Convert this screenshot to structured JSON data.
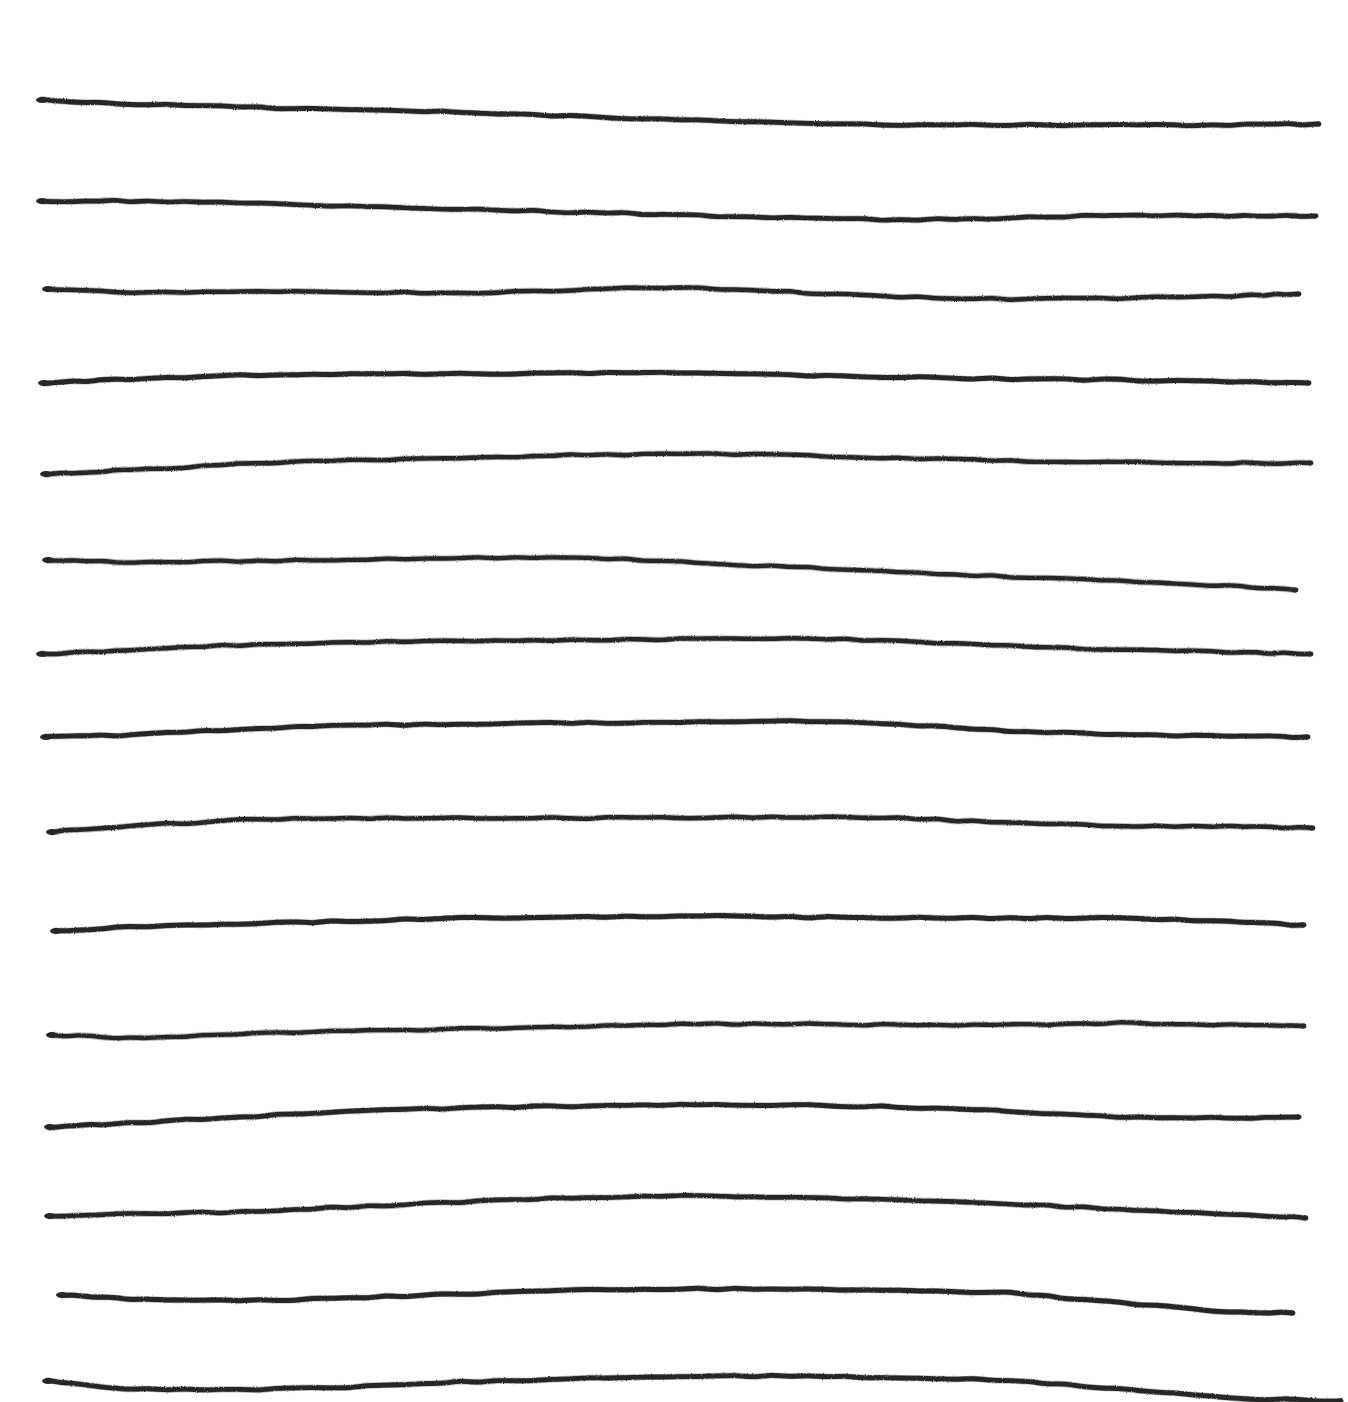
{
  "document": {
    "title": "Hand-drawn Horizontal Lines",
    "medium": "pen-on-paper sketch",
    "background_color": "#ffffff",
    "ink_color": "#262626",
    "canvas": {
      "width": 1348,
      "height": 1402
    },
    "line_count": 15,
    "description": "Fifteen roughly parallel, freehand horizontal lines drawn across a white page, each with gentle undulations and small ink blobs at the terminations."
  },
  "chart_data": {
    "type": "line",
    "subtitle": "",
    "xlabel": "",
    "ylabel": "",
    "xlim": [
      0,
      1348
    ],
    "ylim": [
      0,
      1402
    ],
    "grid": false,
    "legend": null,
    "axis_visible": false,
    "tick_labels_x": [],
    "tick_labels_y": [],
    "stroke_color": "#262626",
    "stroke_width": 4.6,
    "background": "#ffffff",
    "series": [
      {
        "name": "line-1",
        "x_start": 42,
        "x_end": 1318,
        "values": [
          [
            42,
            100
          ],
          [
            130,
            104
          ],
          [
            240,
            107
          ],
          [
            350,
            110
          ],
          [
            460,
            112
          ],
          [
            570,
            116
          ],
          [
            680,
            120
          ],
          [
            790,
            123
          ],
          [
            900,
            125
          ],
          [
            1010,
            125
          ],
          [
            1120,
            125
          ],
          [
            1230,
            125
          ],
          [
            1318,
            124
          ]
        ]
      },
      {
        "name": "line-2",
        "x_start": 42,
        "x_end": 1315,
        "values": [
          [
            42,
            201
          ],
          [
            130,
            201
          ],
          [
            240,
            203
          ],
          [
            350,
            206
          ],
          [
            460,
            209
          ],
          [
            570,
            212
          ],
          [
            680,
            215
          ],
          [
            790,
            218
          ],
          [
            900,
            220
          ],
          [
            1010,
            218
          ],
          [
            1120,
            215
          ],
          [
            1230,
            216
          ],
          [
            1315,
            216
          ]
        ]
      },
      {
        "name": "line-3",
        "x_start": 48,
        "x_end": 1298,
        "values": [
          [
            48,
            289
          ],
          [
            130,
            293
          ],
          [
            240,
            291
          ],
          [
            350,
            292
          ],
          [
            460,
            293
          ],
          [
            570,
            290
          ],
          [
            680,
            287
          ],
          [
            790,
            292
          ],
          [
            900,
            297
          ],
          [
            1010,
            299
          ],
          [
            1120,
            298
          ],
          [
            1230,
            296
          ],
          [
            1298,
            294
          ]
        ]
      },
      {
        "name": "line-4",
        "x_start": 44,
        "x_end": 1308,
        "values": [
          [
            44,
            383
          ],
          [
            130,
            379
          ],
          [
            240,
            375
          ],
          [
            350,
            374
          ],
          [
            460,
            374
          ],
          [
            570,
            373
          ],
          [
            680,
            373
          ],
          [
            790,
            375
          ],
          [
            900,
            377
          ],
          [
            1010,
            379
          ],
          [
            1120,
            380
          ],
          [
            1230,
            382
          ],
          [
            1308,
            383
          ]
        ]
      },
      {
        "name": "line-5",
        "x_start": 46,
        "x_end": 1310,
        "values": [
          [
            46,
            474
          ],
          [
            130,
            470
          ],
          [
            240,
            464
          ],
          [
            350,
            460
          ],
          [
            460,
            458
          ],
          [
            570,
            455
          ],
          [
            680,
            454
          ],
          [
            790,
            455
          ],
          [
            900,
            458
          ],
          [
            1010,
            461
          ],
          [
            1120,
            462
          ],
          [
            1230,
            463
          ],
          [
            1310,
            463
          ]
        ]
      },
      {
        "name": "line-6",
        "x_start": 48,
        "x_end": 1295,
        "values": [
          [
            48,
            560
          ],
          [
            130,
            562
          ],
          [
            240,
            561
          ],
          [
            350,
            560
          ],
          [
            460,
            558
          ],
          [
            570,
            557
          ],
          [
            680,
            562
          ],
          [
            790,
            567
          ],
          [
            900,
            572
          ],
          [
            1010,
            577
          ],
          [
            1120,
            581
          ],
          [
            1230,
            586
          ],
          [
            1295,
            590
          ]
        ]
      },
      {
        "name": "line-7",
        "x_start": 42,
        "x_end": 1310,
        "values": [
          [
            42,
            654
          ],
          [
            130,
            650
          ],
          [
            240,
            645
          ],
          [
            350,
            642
          ],
          [
            460,
            641
          ],
          [
            570,
            640
          ],
          [
            680,
            639
          ],
          [
            790,
            638
          ],
          [
            900,
            641
          ],
          [
            1010,
            646
          ],
          [
            1120,
            650
          ],
          [
            1230,
            652
          ],
          [
            1310,
            654
          ]
        ]
      },
      {
        "name": "line-8",
        "x_start": 46,
        "x_end": 1307,
        "values": [
          [
            46,
            737
          ],
          [
            130,
            735
          ],
          [
            240,
            729
          ],
          [
            350,
            725
          ],
          [
            460,
            724
          ],
          [
            570,
            723
          ],
          [
            680,
            722
          ],
          [
            790,
            721
          ],
          [
            900,
            724
          ],
          [
            1010,
            731
          ],
          [
            1120,
            735
          ],
          [
            1230,
            736
          ],
          [
            1307,
            737
          ]
        ]
      },
      {
        "name": "line-9",
        "x_start": 52,
        "x_end": 1312,
        "values": [
          [
            52,
            832
          ],
          [
            130,
            826
          ],
          [
            240,
            820
          ],
          [
            350,
            818
          ],
          [
            460,
            818
          ],
          [
            570,
            818
          ],
          [
            680,
            818
          ],
          [
            790,
            817
          ],
          [
            900,
            818
          ],
          [
            1010,
            823
          ],
          [
            1120,
            826
          ],
          [
            1230,
            826
          ],
          [
            1312,
            828
          ]
        ]
      },
      {
        "name": "line-10",
        "x_start": 56,
        "x_end": 1303,
        "values": [
          [
            56,
            931
          ],
          [
            130,
            927
          ],
          [
            240,
            924
          ],
          [
            350,
            921
          ],
          [
            460,
            918
          ],
          [
            570,
            917
          ],
          [
            680,
            916
          ],
          [
            790,
            917
          ],
          [
            900,
            918
          ],
          [
            1010,
            918
          ],
          [
            1120,
            918
          ],
          [
            1230,
            922
          ],
          [
            1303,
            925
          ]
        ]
      },
      {
        "name": "line-11",
        "x_start": 52,
        "x_end": 1303,
        "values": [
          [
            52,
            1035
          ],
          [
            130,
            1038
          ],
          [
            240,
            1034
          ],
          [
            350,
            1031
          ],
          [
            460,
            1029
          ],
          [
            570,
            1027
          ],
          [
            680,
            1024
          ],
          [
            790,
            1024
          ],
          [
            900,
            1025
          ],
          [
            1010,
            1025
          ],
          [
            1120,
            1023
          ],
          [
            1230,
            1025
          ],
          [
            1303,
            1026
          ]
        ]
      },
      {
        "name": "line-12",
        "x_start": 50,
        "x_end": 1298,
        "values": [
          [
            50,
            1127
          ],
          [
            130,
            1123
          ],
          [
            240,
            1117
          ],
          [
            350,
            1111
          ],
          [
            460,
            1108
          ],
          [
            570,
            1106
          ],
          [
            680,
            1105
          ],
          [
            790,
            1105
          ],
          [
            900,
            1107
          ],
          [
            1010,
            1111
          ],
          [
            1120,
            1117
          ],
          [
            1230,
            1118
          ],
          [
            1298,
            1117
          ]
        ]
      },
      {
        "name": "line-13",
        "x_start": 50,
        "x_end": 1305,
        "values": [
          [
            50,
            1216
          ],
          [
            130,
            1214
          ],
          [
            240,
            1212
          ],
          [
            350,
            1207
          ],
          [
            460,
            1202
          ],
          [
            570,
            1198
          ],
          [
            680,
            1196
          ],
          [
            790,
            1197
          ],
          [
            900,
            1200
          ],
          [
            1010,
            1204
          ],
          [
            1120,
            1209
          ],
          [
            1230,
            1214
          ],
          [
            1305,
            1218
          ]
        ]
      },
      {
        "name": "line-14",
        "x_start": 62,
        "x_end": 1292,
        "values": [
          [
            62,
            1295
          ],
          [
            130,
            1299
          ],
          [
            240,
            1301
          ],
          [
            350,
            1298
          ],
          [
            460,
            1294
          ],
          [
            570,
            1290
          ],
          [
            680,
            1289
          ],
          [
            790,
            1289
          ],
          [
            900,
            1290
          ],
          [
            1010,
            1293
          ],
          [
            1120,
            1303
          ],
          [
            1230,
            1312
          ],
          [
            1292,
            1313
          ]
        ]
      },
      {
        "name": "line-15",
        "x_start": 48,
        "x_end": 1340,
        "values": [
          [
            48,
            1381
          ],
          [
            130,
            1389
          ],
          [
            240,
            1390
          ],
          [
            350,
            1387
          ],
          [
            460,
            1382
          ],
          [
            570,
            1379
          ],
          [
            680,
            1376
          ],
          [
            790,
            1376
          ],
          [
            900,
            1378
          ],
          [
            1010,
            1380
          ],
          [
            1120,
            1389
          ],
          [
            1230,
            1398
          ],
          [
            1340,
            1401
          ]
        ]
      }
    ]
  }
}
